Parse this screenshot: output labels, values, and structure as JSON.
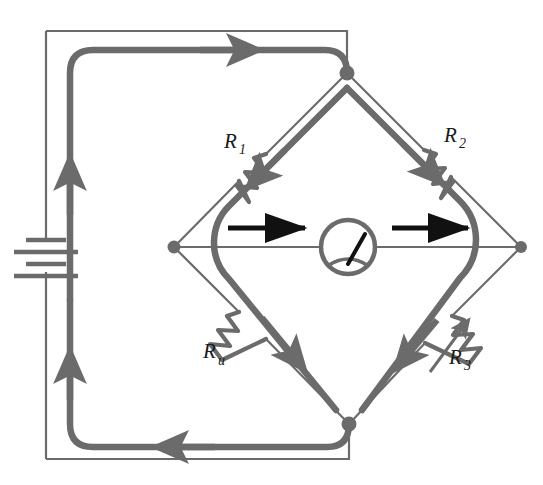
{
  "figure": {
    "type": "circuit-diagram",
    "name": "Wheatstone bridge",
    "background_color": "#ffffff",
    "wire_color": "#6b6b6b",
    "current_path_color": "#6b6b6b",
    "arrow_color": "#111111",
    "label_color": "#1a1a1a"
  },
  "components": {
    "battery": {
      "name": "battery",
      "symbol": "battery-cells",
      "plate_count": 4
    },
    "galvanometer": {
      "name": "galvanometer",
      "symbol": "meter-circle-needle"
    },
    "resistors": [
      {
        "id": "R1",
        "label_main": "R",
        "label_sub": "1",
        "arm": "top-left",
        "variable": false
      },
      {
        "id": "R2",
        "label_main": "R",
        "label_sub": "2",
        "arm": "top-right",
        "variable": false
      },
      {
        "id": "Ru",
        "label_main": "R",
        "label_sub": "u",
        "arm": "bottom-left",
        "variable": false
      },
      {
        "id": "R3",
        "label_main": "R",
        "label_sub": "3",
        "arm": "bottom-right",
        "variable": true
      }
    ],
    "nodes": [
      {
        "id": "top",
        "x": 347,
        "y": 73
      },
      {
        "id": "left",
        "x": 174,
        "y": 247
      },
      {
        "id": "right",
        "x": 521,
        "y": 247
      },
      {
        "id": "bottom",
        "x": 349,
        "y": 424
      }
    ]
  },
  "annotations": {
    "current_arrows": [
      {
        "id": "bridge-arrow-left",
        "direction": "right"
      },
      {
        "id": "bridge-arrow-right",
        "direction": "right"
      },
      {
        "id": "supply-arrow-top",
        "direction": "right"
      },
      {
        "id": "supply-arrow-bottom",
        "direction": "left"
      },
      {
        "id": "supply-arrow-up",
        "direction": "up"
      },
      {
        "id": "supply-arrow-return",
        "direction": "up"
      },
      {
        "id": "arm-arrow-r1",
        "direction": "down-left"
      },
      {
        "id": "arm-arrow-r2",
        "direction": "down-right"
      },
      {
        "id": "arm-arrow-ru",
        "direction": "down-right"
      },
      {
        "id": "arm-arrow-r3",
        "direction": "down-left"
      }
    ]
  }
}
